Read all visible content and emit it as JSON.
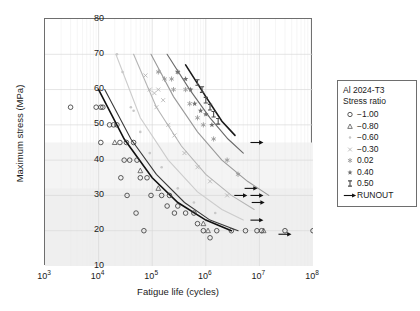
{
  "chart_data": {
    "type": "scatter",
    "title": "",
    "xlabel": "Fatigue life (cycles)",
    "ylabel": "Maximum stress (MPa)",
    "xscale": "log",
    "yscale": "linear",
    "xlim": [
      1000,
      100000000
    ],
    "ylim": [
      10,
      80
    ],
    "yticks": [
      10,
      20,
      30,
      40,
      50,
      60,
      70,
      80
    ],
    "xticks": [
      "10^3",
      "10^4",
      "10^5",
      "10^6",
      "10^7",
      "10^8"
    ],
    "xtick_labels": [
      "3",
      "4",
      "5",
      "6",
      "7",
      "8"
    ],
    "grid": true,
    "legend_position": "right-outside",
    "legend_title_line1": "Al 2024-T3",
    "legend_title_line2": "Stress ratio",
    "series": [
      {
        "name": "-1.00",
        "marker": "circle-open",
        "color": "#333333",
        "curve_color": "#111111",
        "points": [
          [
            3000,
            55
          ],
          [
            9000,
            55
          ],
          [
            11000,
            55
          ],
          [
            12000,
            55
          ],
          [
            16000,
            50
          ],
          [
            19000,
            50
          ],
          [
            22000,
            50
          ],
          [
            11000,
            45
          ],
          [
            25000,
            45
          ],
          [
            33000,
            45
          ],
          [
            45000,
            45
          ],
          [
            30000,
            40
          ],
          [
            38000,
            40
          ],
          [
            52000,
            40
          ],
          [
            26000,
            35
          ],
          [
            60000,
            35
          ],
          [
            80000,
            35
          ],
          [
            34000,
            30
          ],
          [
            95000,
            30
          ],
          [
            150000,
            30
          ],
          [
            210000,
            30
          ],
          [
            190000,
            27
          ],
          [
            300000,
            27
          ],
          [
            50000,
            25
          ],
          [
            260000,
            25
          ],
          [
            420000,
            25
          ],
          [
            600000,
            25
          ],
          [
            700000,
            22
          ],
          [
            70000,
            20
          ],
          [
            900000,
            20
          ],
          [
            1600000,
            20
          ],
          [
            3000000,
            20
          ],
          [
            5500000,
            20
          ],
          [
            9000000,
            20
          ],
          [
            11000000,
            20
          ],
          [
            30000000,
            20
          ],
          [
            100000000,
            20
          ],
          [
            1200000,
            18
          ]
        ],
        "curve": [
          [
            10000,
            60
          ],
          [
            30000,
            46
          ],
          [
            100000,
            35
          ],
          [
            300000,
            28
          ],
          [
            1000000,
            23
          ],
          [
            3000000,
            20
          ]
        ]
      },
      {
        "name": "-0.80",
        "marker": "triangle-open",
        "color": "#555555",
        "curve_color": "#3a3a3a",
        "points": [
          [
            20000,
            45
          ],
          [
            60000,
            37
          ],
          [
            130000,
            32
          ],
          [
            900000,
            22
          ],
          [
            1100000,
            20
          ],
          [
            12000000,
            20
          ]
        ],
        "curve": [
          [
            13000,
            60
          ],
          [
            40000,
            46
          ],
          [
            120000,
            36
          ],
          [
            400000,
            28
          ],
          [
            1200000,
            23
          ],
          [
            4000000,
            20
          ]
        ]
      },
      {
        "name": "-0.60",
        "marker": "dot-light",
        "color": "#c8c8c8",
        "curve_color": "#cccccc",
        "points": [
          [
            22000,
            70
          ],
          [
            28000,
            65
          ],
          [
            40000,
            55
          ],
          [
            45000,
            54
          ],
          [
            60000,
            48
          ],
          [
            90000,
            42
          ],
          [
            150000,
            38
          ],
          [
            300000,
            32
          ],
          [
            600000,
            28
          ],
          [
            1500000,
            25
          ]
        ],
        "curve": [
          [
            21000,
            70
          ],
          [
            60000,
            52
          ],
          [
            200000,
            40
          ],
          [
            700000,
            31
          ],
          [
            2000000,
            26
          ],
          [
            5000000,
            23
          ]
        ]
      },
      {
        "name": "-0.30",
        "marker": "x-light",
        "color": "#b0b0b0",
        "curve_color": "#b5b5b5",
        "points": [
          [
            75000,
            64
          ],
          [
            90000,
            60
          ],
          [
            110000,
            59
          ],
          [
            130000,
            60
          ],
          [
            160000,
            57
          ],
          [
            120000,
            55
          ],
          [
            200000,
            50
          ],
          [
            260000,
            47
          ],
          [
            400000,
            42
          ],
          [
            700000,
            38
          ],
          [
            1200000,
            34
          ],
          [
            2500000,
            30
          ]
        ],
        "curve": [
          [
            45000,
            70
          ],
          [
            120000,
            55
          ],
          [
            350000,
            44
          ],
          [
            1000000,
            36
          ],
          [
            3000000,
            30
          ],
          [
            8000000,
            26
          ]
        ]
      },
      {
        "name": "0.02",
        "marker": "asterisk",
        "color": "#999999",
        "curve_color": "#9a9a9a",
        "points": [
          [
            130000,
            65
          ],
          [
            170000,
            63
          ],
          [
            230000,
            63
          ],
          [
            300000,
            65
          ],
          [
            250000,
            60
          ],
          [
            420000,
            60
          ],
          [
            500000,
            56
          ],
          [
            700000,
            52
          ],
          [
            900000,
            50
          ],
          [
            1400000,
            46
          ],
          [
            2500000,
            40
          ],
          [
            4000000,
            36
          ]
        ],
        "curve": [
          [
            95000,
            70
          ],
          [
            250000,
            58
          ],
          [
            700000,
            48
          ],
          [
            2000000,
            40
          ],
          [
            6000000,
            34
          ],
          [
            15000000,
            30
          ]
        ]
      },
      {
        "name": "0.40",
        "marker": "star",
        "color": "#707070",
        "curve_color": "#6a6a6a",
        "points": [
          [
            300000,
            65
          ],
          [
            420000,
            63
          ],
          [
            520000,
            60
          ],
          [
            620000,
            56
          ],
          [
            800000,
            54
          ],
          [
            1000000,
            53
          ],
          [
            1300000,
            50
          ]
        ],
        "curve": [
          [
            190000,
            70
          ],
          [
            500000,
            60
          ],
          [
            1200000,
            52
          ],
          [
            2600000,
            46
          ],
          [
            5000000,
            42
          ]
        ]
      },
      {
        "name": "0.50",
        "marker": "dumbbell",
        "color": "#4a4a4a",
        "curve_color": "#1a1a1a",
        "points": [
          [
            700000,
            62
          ],
          [
            850000,
            60
          ],
          [
            1000000,
            57
          ],
          [
            1200000,
            55
          ],
          [
            1400000,
            53
          ],
          [
            1700000,
            51
          ]
        ],
        "curve": [
          [
            420000,
            67
          ],
          [
            1000000,
            58
          ],
          [
            2000000,
            51
          ],
          [
            3500000,
            47
          ]
        ]
      },
      {
        "name": "RUNOUT",
        "marker": "arrow",
        "color": "#111111",
        "points": [
          [
            9000000,
            45
          ],
          [
            7000000,
            32
          ],
          [
            4500000,
            30
          ],
          [
            9000000,
            30
          ],
          [
            9500000,
            28
          ],
          [
            9000000,
            23
          ],
          [
            30000000,
            19
          ]
        ]
      }
    ]
  },
  "axes": {
    "ylabel": "Maximum stress (MPa)",
    "xlabel": "Fatigue life (cycles)",
    "ytick_labels": [
      "80",
      "70",
      "60",
      "50",
      "40",
      "30",
      "20",
      "10"
    ],
    "xtick_bases": [
      "10",
      "10",
      "10",
      "10",
      "10",
      "10"
    ],
    "xtick_exps": [
      "3",
      "4",
      "5",
      "6",
      "7",
      "8"
    ]
  },
  "legend": {
    "title1": "Al 2024-T3",
    "title2": "Stress ratio",
    "entries": [
      {
        "label": "−1.00",
        "marker": "circle-open"
      },
      {
        "label": "−0.80",
        "marker": "triangle-open"
      },
      {
        "label": "−0.60",
        "marker": "dot-light"
      },
      {
        "label": "−0.30",
        "marker": "x-light"
      },
      {
        "label": "0.02",
        "marker": "asterisk"
      },
      {
        "label": "0.40",
        "marker": "star"
      },
      {
        "label": "0.50",
        "marker": "dumbbell"
      },
      {
        "label": "RUNOUT",
        "marker": "arrow"
      }
    ]
  }
}
